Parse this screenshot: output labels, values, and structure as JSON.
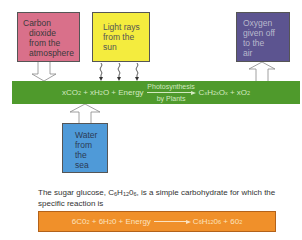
{
  "boxes": {
    "carbon_dioxide": {
      "lines": [
        "Carbon",
        "dioxide",
        "from the",
        "atmosphere"
      ],
      "color": "#d9708a"
    },
    "light_rays": {
      "lines": [
        "Light rays",
        "from the",
        "sun"
      ],
      "color": "#f4ec3e"
    },
    "oxygen": {
      "lines": [
        "Oxygen",
        "given off",
        "to the",
        "air"
      ],
      "color": "#5c5490"
    },
    "water": {
      "lines": [
        "Water",
        "from",
        "the",
        "sea"
      ],
      "color": "#4f9ad8"
    }
  },
  "general_equation": {
    "left": "xCO",
    "left_sub": "2",
    "plus1": " + xH",
    "h_sub": "2",
    "o_energy": "O + Energy",
    "arrow_top": "Photosynthesis",
    "arrow_bottom": "by Plants",
    "c": "C",
    "c_sub": "x",
    "h": "H",
    "h2_sub": "2x",
    "o": "O",
    "o_sub": "x",
    "plus2": " + xO",
    "o2_sub": "2",
    "color": "#4f9a2c"
  },
  "caption": {
    "part1": "The sugar glucose, C",
    "sub1": "6",
    "part2": "H",
    "sub2": "12",
    "part3": "0",
    "sub3": "6",
    "part4": ", is a simple carbohydrate for which the specific reaction is"
  },
  "specific_equation": {
    "a": "6C0",
    "a_sub": "2",
    "b": " + 6H",
    "b_sub": "2",
    "c": "0 + Energy",
    "d": "C",
    "d_sub": "6",
    "e": "H",
    "e_sub": "12",
    "f": "0",
    "f_sub": "6",
    "g": " + 60",
    "g_sub": "2",
    "color": "#f0902a"
  }
}
